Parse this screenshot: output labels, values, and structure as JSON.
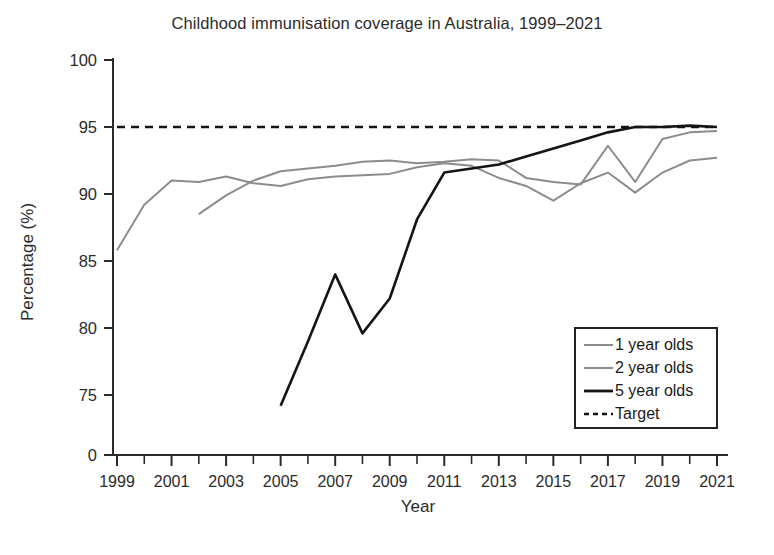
{
  "chart_data": {
    "type": "line",
    "title": "Childhood immunisation coverage in Australia, 1999–2021",
    "xlabel": "Year",
    "ylabel": "Percentage (%)",
    "xlim": [
      1999,
      2021
    ],
    "ylim": [
      74,
      100
    ],
    "y_axis_broken": true,
    "y_break_note": "axis shows 0 then jumps to 75",
    "ytick_labels": [
      "0",
      "75",
      "80",
      "85",
      "90",
      "95",
      "100"
    ],
    "ytick_values": [
      0,
      75,
      80,
      85,
      90,
      95,
      100
    ],
    "xtick_labels": [
      "1999",
      "2001",
      "2003",
      "2005",
      "2007",
      "2009",
      "2011",
      "2013",
      "2015",
      "2017",
      "2019",
      "2021"
    ],
    "xtick_values": [
      1999,
      2001,
      2003,
      2005,
      2007,
      2009,
      2011,
      2013,
      2015,
      2017,
      2019,
      2021
    ],
    "x_minor_ticks": [
      2000,
      2002,
      2004,
      2006,
      2008,
      2010,
      2012,
      2014,
      2016,
      2018,
      2020
    ],
    "grid": false,
    "legend_position": "lower right",
    "series": [
      {
        "name": "1 year olds",
        "color": "#8c8c8c",
        "style": "solid",
        "width": 2.0,
        "x": [
          1999,
          2000,
          2001,
          2002,
          2003,
          2004,
          2005,
          2006,
          2007,
          2008,
          2009,
          2010,
          2011,
          2012,
          2013,
          2014,
          2015,
          2016,
          2017,
          2018,
          2019,
          2020,
          2021
        ],
        "values": [
          85.8,
          89.2,
          91.0,
          90.9,
          91.3,
          90.8,
          90.6,
          91.1,
          91.3,
          91.4,
          91.5,
          92.0,
          92.3,
          92.1,
          91.2,
          90.6,
          89.5,
          90.8,
          91.6,
          90.1,
          91.6,
          92.5,
          92.7
        ]
      },
      {
        "name": "2 year olds",
        "color": "#8c8c8c",
        "style": "solid",
        "width": 2.0,
        "x": [
          2002,
          2003,
          2004,
          2005,
          2006,
          2007,
          2008,
          2009,
          2010,
          2011,
          2012,
          2013,
          2014,
          2015,
          2016,
          2017,
          2018,
          2019,
          2020,
          2021
        ],
        "values": [
          88.5,
          89.9,
          91.0,
          91.7,
          91.9,
          92.1,
          92.4,
          92.5,
          92.3,
          92.4,
          92.6,
          92.5,
          91.2,
          90.9,
          90.7,
          93.6,
          90.9,
          94.1,
          94.6,
          94.7
        ]
      },
      {
        "name": "5 year olds",
        "color": "#141414",
        "style": "solid",
        "width": 2.6,
        "x": [
          2005,
          2006,
          2007,
          2008,
          2009,
          2010,
          2011,
          2012,
          2013,
          2014,
          2015,
          2016,
          2017,
          2018,
          2019,
          2020,
          2021
        ],
        "values": [
          74.2,
          79.0,
          84.0,
          79.6,
          82.2,
          88.1,
          91.6,
          91.9,
          92.2,
          92.8,
          93.4,
          94.0,
          94.6,
          95.0,
          95.0,
          95.1,
          95.0
        ]
      },
      {
        "name": "Target",
        "color": "#141414",
        "style": "dashed",
        "width": 2.4,
        "x": [
          1999,
          2021
        ],
        "values": [
          95,
          95
        ]
      }
    ],
    "legend_entries": [
      {
        "label": "1 year olds",
        "color": "#8c8c8c",
        "style": "solid",
        "width": 2.0
      },
      {
        "label": "2 year olds",
        "color": "#8c8c8c",
        "style": "solid",
        "width": 2.0
      },
      {
        "label": "5 year olds",
        "color": "#141414",
        "style": "solid",
        "width": 2.8
      },
      {
        "label": "Target",
        "color": "#141414",
        "style": "dashed",
        "width": 2.4
      }
    ]
  },
  "colors": {
    "background": "#ffffff",
    "axis": "#2b2b2b",
    "text": "#2b2b2b",
    "one_year": "#8c8c8c",
    "two_year": "#8c8c8c",
    "five_year": "#141414",
    "target": "#141414"
  }
}
